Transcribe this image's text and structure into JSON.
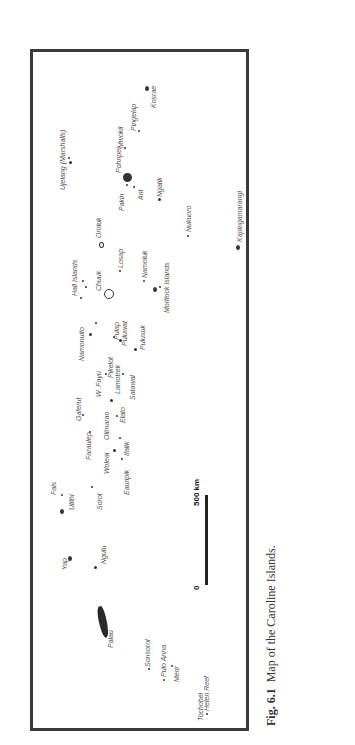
{
  "figure": {
    "caption_number": "Fig. 6.1",
    "caption_text": "Map of the Caroline Islands."
  },
  "scale_bar": {
    "start_label": "0",
    "end_label": "500 km"
  },
  "islands": [
    {
      "id": "ujelang",
      "label": "Ujelang (Marshalls)"
    },
    {
      "id": "kosrae",
      "label": "Kosrae"
    },
    {
      "id": "pingelap",
      "label": "Pingelap"
    },
    {
      "id": "mwokil",
      "label": "Mwokil"
    },
    {
      "id": "pohnpei",
      "label": "Pohnpei"
    },
    {
      "id": "pakin",
      "label": "Pakin"
    },
    {
      "id": "ant",
      "label": "Ant"
    },
    {
      "id": "ngatik",
      "label": "Ngatik"
    },
    {
      "id": "oroluk",
      "label": "Oroluk"
    },
    {
      "id": "nukuoro",
      "label": "Nukuoro"
    },
    {
      "id": "kapingamarangi",
      "label": "Kapingamarangi"
    },
    {
      "id": "mortlock",
      "label": "Mortlock Islands"
    },
    {
      "id": "namoluk",
      "label": "Namoluk"
    },
    {
      "id": "losap",
      "label": "Losap"
    },
    {
      "id": "hall",
      "label": "Hall Islands"
    },
    {
      "id": "chuuk",
      "label": "Chuuk"
    },
    {
      "id": "namonuito",
      "label": "Namonuito"
    },
    {
      "id": "pulap",
      "label": "Pulap"
    },
    {
      "id": "puluwat",
      "label": "Puluwat"
    },
    {
      "id": "pulusuk",
      "label": "Pulusuk"
    },
    {
      "id": "pikelot",
      "label": "Pikelot"
    },
    {
      "id": "wfayu",
      "label": "W. Fayu"
    },
    {
      "id": "lamotrek",
      "label": "Lamotrek"
    },
    {
      "id": "satawal",
      "label": "Satawal"
    },
    {
      "id": "gaferut",
      "label": "Gaferut"
    },
    {
      "id": "olimarao",
      "label": "Olimarao"
    },
    {
      "id": "elato",
      "label": "Elato"
    },
    {
      "id": "faraulep",
      "label": "Faraulep"
    },
    {
      "id": "woleai",
      "label": "Woleai"
    },
    {
      "id": "ifalik",
      "label": "Ifalik"
    },
    {
      "id": "eauripik",
      "label": "Eauripik"
    },
    {
      "id": "fais",
      "label": "Fais"
    },
    {
      "id": "ulithi",
      "label": "Ulithi"
    },
    {
      "id": "sorol",
      "label": "Sorol"
    },
    {
      "id": "yap",
      "label": "Yap"
    },
    {
      "id": "ngulu",
      "label": "Ngulu"
    },
    {
      "id": "palau",
      "label": "Palau"
    },
    {
      "id": "sonsorol",
      "label": "Sonsorol"
    },
    {
      "id": "puloanna",
      "label": "Pulo Anna"
    },
    {
      "id": "merir",
      "label": "Merir"
    },
    {
      "id": "tochobei",
      "label": "Tochobei"
    },
    {
      "id": "helen",
      "label": "Helen Reef"
    }
  ]
}
